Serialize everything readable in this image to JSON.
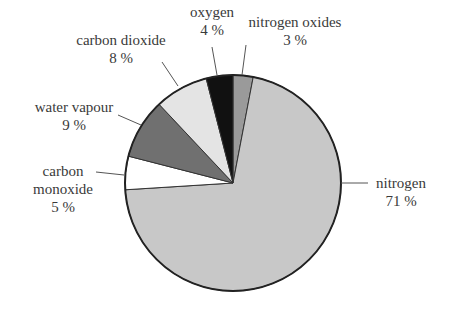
{
  "chart_data": {
    "type": "pie",
    "title": "",
    "start_angle_deg": 0,
    "direction": "clockwise",
    "center": [
      233,
      183
    ],
    "radius": 108,
    "slices": [
      {
        "label": "nitrogen oxides",
        "value": 3,
        "pct_label": "3 %",
        "color": "#9a9a9a"
      },
      {
        "label": "nitrogen",
        "value": 71,
        "pct_label": "71 %",
        "color": "#c8c8c8"
      },
      {
        "label": "carbon monoxide",
        "value": 5,
        "pct_label": "5 %",
        "color": "#ffffff"
      },
      {
        "label": "water vapour",
        "value": 9,
        "pct_label": "9 %",
        "color": "#707070"
      },
      {
        "label": "carbon dioxide",
        "value": 8,
        "pct_label": "8 %",
        "color": "#e4e4e4"
      },
      {
        "label": "oxygen",
        "value": 4,
        "pct_label": "4 %",
        "color": "#111111"
      }
    ]
  },
  "labels": {
    "nitrogen_oxides": {
      "name": "nitrogen oxides",
      "pct": "3 %"
    },
    "nitrogen": {
      "name": "nitrogen",
      "pct": "71 %"
    },
    "carbon_monoxide": {
      "name1": "carbon",
      "name2": "monoxide",
      "pct": "5 %"
    },
    "water_vapour": {
      "name": "water vapour",
      "pct": "9 %"
    },
    "carbon_dioxide": {
      "name": "carbon dioxide",
      "pct": "8 %"
    },
    "oxygen": {
      "name": "oxygen",
      "pct": "4 %"
    }
  }
}
